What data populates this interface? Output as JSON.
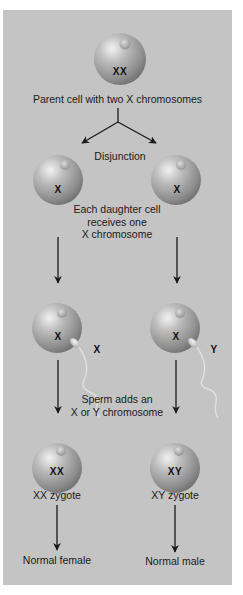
{
  "figure": {
    "panel_color": "#c4c4c4",
    "cell_color": "#9a9a9a",
    "arrow_color": "#1a1a1a"
  },
  "parent": {
    "chromosomes": "XX",
    "caption": "Parent cell with two X chromosomes"
  },
  "disjunction": {
    "label": "Disjunction",
    "left_cell_chromosome": "X",
    "right_cell_chromosome": "X",
    "caption_lines": [
      "Each daughter cell",
      "receives one",
      "X chromosome"
    ]
  },
  "fertilization": {
    "left_egg_chromosome": "X",
    "left_sperm_chromosome": "X",
    "right_egg_chromosome": "X",
    "right_sperm_chromosome": "Y",
    "caption_lines": [
      "Sperm adds an",
      "X or Y chromosome"
    ]
  },
  "zygotes": {
    "left": {
      "chromosomes": "XX",
      "label": "XX zygote",
      "outcome": "Normal female"
    },
    "right": {
      "chromosomes": "XY",
      "label": "XY zygote",
      "outcome": "Normal male"
    }
  }
}
